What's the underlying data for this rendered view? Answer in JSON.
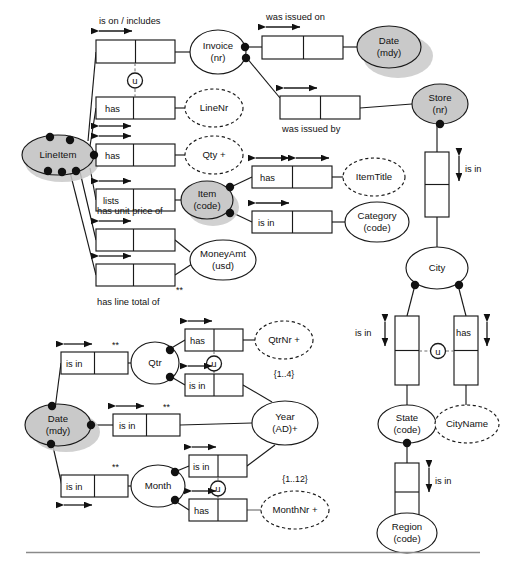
{
  "diagram": {
    "type": "orm-conceptual-schema",
    "entities": [
      {
        "id": "invoice",
        "label_1": "Invoice",
        "label_2": "(nr)",
        "shape": "ellipse",
        "style": "solid",
        "shaded": false
      },
      {
        "id": "date_top",
        "label_1": "Date",
        "label_2": "(mdy)",
        "shape": "ellipse",
        "style": "solid",
        "shaded": true
      },
      {
        "id": "store",
        "label_1": "Store",
        "label_2": "(nr)",
        "shape": "ellipse",
        "style": "solid",
        "shaded": true
      },
      {
        "id": "lineitem",
        "label_1": "LineItem",
        "label_2": "",
        "shape": "ellipse",
        "style": "solid",
        "shaded": true
      },
      {
        "id": "linenr",
        "label_1": "LineNr",
        "label_2": "",
        "shape": "ellipse",
        "style": "dashed",
        "shaded": false
      },
      {
        "id": "qty",
        "label_1": "Qty +",
        "label_2": "",
        "shape": "ellipse",
        "style": "dashed",
        "shaded": false
      },
      {
        "id": "item",
        "label_1": "Item",
        "label_2": "(code)",
        "shape": "ellipse",
        "style": "solid",
        "shaded": true
      },
      {
        "id": "itemtitle",
        "label_1": "ItemTitle",
        "label_2": "",
        "shape": "ellipse",
        "style": "dashed",
        "shaded": false
      },
      {
        "id": "category",
        "label_1": "Category",
        "label_2": "(code)",
        "shape": "ellipse",
        "style": "solid",
        "shaded": false
      },
      {
        "id": "moneyamt",
        "label_1": "MoneyAmt",
        "label_2": "(usd)",
        "shape": "ellipse",
        "style": "solid",
        "shaded": false
      },
      {
        "id": "city",
        "label_1": "City",
        "label_2": "",
        "shape": "ellipse",
        "style": "solid",
        "shaded": false
      },
      {
        "id": "state",
        "label_1": "State",
        "label_2": "(code)",
        "shape": "ellipse",
        "style": "solid",
        "shaded": false
      },
      {
        "id": "cityname",
        "label_1": "CityName",
        "label_2": "",
        "shape": "ellipse",
        "style": "dashed",
        "shaded": false
      },
      {
        "id": "region",
        "label_1": "Region",
        "label_2": "(code)",
        "shape": "ellipse",
        "style": "solid",
        "shaded": false
      },
      {
        "id": "qtr",
        "label_1": "Qtr",
        "label_2": "",
        "shape": "ellipse",
        "style": "solid",
        "shaded": false
      },
      {
        "id": "qtrnr",
        "label_1": "QtrNr +",
        "label_2": "",
        "shape": "ellipse",
        "style": "dashed",
        "shaded": false
      },
      {
        "id": "year",
        "label_1": "Year",
        "label_2": "(AD)+",
        "shape": "ellipse",
        "style": "solid",
        "shaded": false
      },
      {
        "id": "date_bot",
        "label_1": "Date",
        "label_2": "(mdy)",
        "shape": "ellipse",
        "style": "solid",
        "shaded": true
      },
      {
        "id": "month",
        "label_1": "Month",
        "label_2": "",
        "shape": "ellipse",
        "style": "solid",
        "shaded": false
      },
      {
        "id": "monthnr",
        "label_1": "MonthNr +",
        "label_2": "",
        "shape": "ellipse",
        "style": "dashed",
        "shaded": false
      }
    ],
    "predicates": [
      {
        "id": "p_is_on",
        "text": "is on / includes",
        "role_text": "",
        "position": "above"
      },
      {
        "id": "p_was_issued_on",
        "text": "was issued on",
        "role_text": "",
        "position": "above"
      },
      {
        "id": "p_was_issued_by",
        "text": "was issued by",
        "role_text": "",
        "position": "below"
      },
      {
        "id": "p_has_linenr",
        "text": "",
        "role_text": "has",
        "position": "in-box"
      },
      {
        "id": "p_has_qty",
        "text": "",
        "role_text": "has",
        "position": "in-box"
      },
      {
        "id": "p_lists",
        "text": "",
        "role_text": "lists",
        "position": "in-box"
      },
      {
        "id": "p_has_unit_price",
        "text": "has unit price of",
        "role_text": "",
        "position": "above"
      },
      {
        "id": "p_has_line_total",
        "text": "has line total of",
        "role_text": "",
        "position": "below"
      },
      {
        "id": "p_item_has_title",
        "text": "",
        "role_text": "has",
        "position": "in-box"
      },
      {
        "id": "p_item_is_in",
        "text": "",
        "role_text": "is in",
        "position": "in-box"
      },
      {
        "id": "p_store_is_in_city",
        "text": "is in",
        "role_text": "",
        "position": "right"
      },
      {
        "id": "p_city_is_in_state",
        "text": "is in",
        "role_text": "",
        "position": "left"
      },
      {
        "id": "p_city_has_name",
        "text": "",
        "role_text": "has",
        "position": "in-box"
      },
      {
        "id": "p_state_is_in_region",
        "text": "is in",
        "role_text": "",
        "position": "right"
      },
      {
        "id": "p_date_is_in_qtr",
        "text": "",
        "role_text": "is in",
        "position": "in-box"
      },
      {
        "id": "p_qtr_has_nr",
        "text": "",
        "role_text": "has",
        "position": "in-box"
      },
      {
        "id": "p_qtr_is_in_year",
        "text": "",
        "role_text": "is in",
        "position": "in-box"
      },
      {
        "id": "p_date_is_in_year",
        "text": "",
        "role_text": "is in",
        "position": "in-box"
      },
      {
        "id": "p_month_is_in_year",
        "text": "",
        "role_text": "is in",
        "position": "in-box"
      },
      {
        "id": "p_date_is_in_month",
        "text": "",
        "role_text": "is in",
        "position": "in-box"
      },
      {
        "id": "p_month_has_nr",
        "text": "",
        "role_text": "has",
        "position": "in-box"
      }
    ],
    "constraints": [
      {
        "id": "c_qtrnr_range",
        "text": "{1..4}",
        "attached_to": "qtrnr"
      },
      {
        "id": "c_monthnr_range",
        "text": "{1..12}",
        "attached_to": "monthnr"
      },
      {
        "id": "c_star_linetotal",
        "text": "**",
        "attached_to": "p_has_line_total"
      },
      {
        "id": "c_star_date_qtr",
        "text": "**",
        "attached_to": "p_date_is_in_qtr"
      },
      {
        "id": "c_star_date_year",
        "text": "**",
        "attached_to": "p_date_is_in_year"
      },
      {
        "id": "c_star_date_month",
        "text": "**",
        "attached_to": "p_date_is_in_month"
      },
      {
        "id": "c_u_invoice_linenr",
        "text": "u",
        "attached_to": "p_has_linenr"
      },
      {
        "id": "c_u_city",
        "text": "u",
        "attached_to": "p_city_has_name"
      },
      {
        "id": "c_u_qtr",
        "text": "u",
        "attached_to": "p_qtr_has_nr"
      },
      {
        "id": "c_u_month",
        "text": "u",
        "attached_to": "p_month_has_nr"
      }
    ],
    "legend": {
      "derivation_marker": "**",
      "external_uniqueness_marker": "u",
      "value_constraint_marker": "{..}"
    }
  }
}
